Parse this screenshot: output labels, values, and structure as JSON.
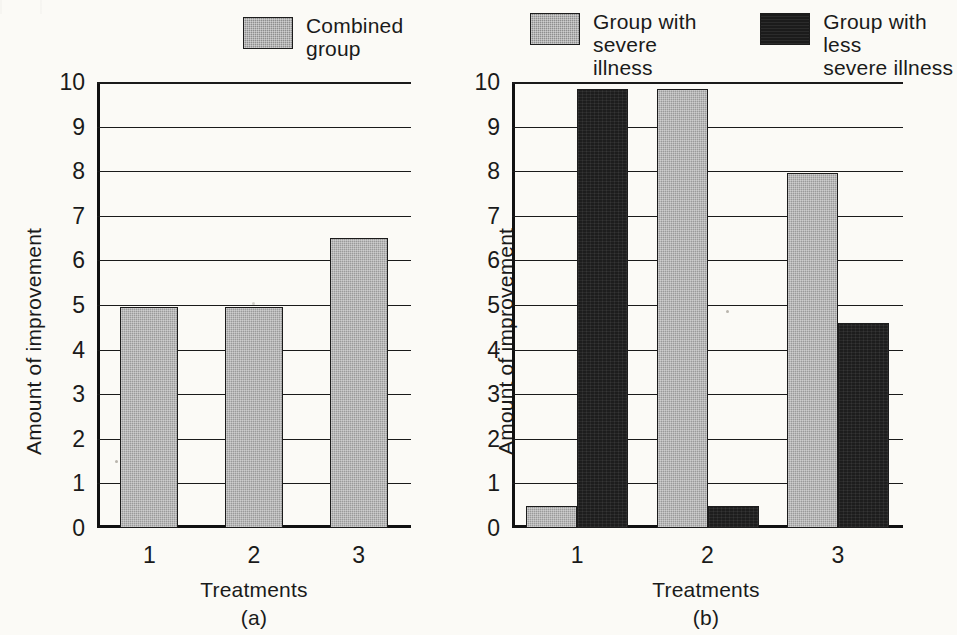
{
  "figure": {
    "background_color": "#fbfaf6",
    "series_colors": {
      "gray": "#9a9a9a",
      "black": "#1d1d1d"
    }
  },
  "panel_a": {
    "tag": "(a)",
    "legend": [
      {
        "name": "combined-group",
        "label": "Combined\ngroup",
        "color": "#9a9a9a"
      }
    ],
    "ylabel": "Amount of improvement",
    "xlabel": "Treatments",
    "yticks": [
      "10",
      "9",
      "8",
      "7",
      "6",
      "5",
      "4",
      "3",
      "2",
      "1",
      "0"
    ],
    "xticks": [
      "1",
      "2",
      "3"
    ]
  },
  "panel_b": {
    "tag": "(b)",
    "legend": [
      {
        "name": "group-severe",
        "label": "Group with\nsevere illness",
        "color": "#9a9a9a"
      },
      {
        "name": "group-less-severe",
        "label": "Group with less\nsevere illness",
        "color": "#1d1d1d"
      }
    ],
    "ylabel": "Amount of improvement",
    "xlabel": "Treatments",
    "yticks": [
      "10",
      "9",
      "8",
      "7",
      "6",
      "5",
      "4",
      "3",
      "2",
      "1",
      "0"
    ],
    "xticks": [
      "1",
      "2",
      "3"
    ]
  },
  "chart_data": [
    {
      "type": "bar",
      "panel": "(a)",
      "title": "",
      "xlabel": "Treatments",
      "ylabel": "Amount of improvement",
      "categories": [
        "1",
        "2",
        "3"
      ],
      "series": [
        {
          "name": "Combined group",
          "color": "#9a9a9a",
          "values": [
            4.95,
            4.95,
            6.5
          ]
        }
      ],
      "ylim": [
        0,
        10
      ],
      "ytick_step": 1,
      "grid": true,
      "legend_position": "top-right"
    },
    {
      "type": "bar",
      "panel": "(b)",
      "title": "",
      "xlabel": "Treatments",
      "ylabel": "Amount of improvement",
      "categories": [
        "1",
        "2",
        "3"
      ],
      "series": [
        {
          "name": "Group with severe illness",
          "color": "#9a9a9a",
          "values": [
            0.5,
            9.85,
            7.95
          ]
        },
        {
          "name": "Group with less severe illness",
          "color": "#1d1d1d",
          "values": [
            9.85,
            0.5,
            4.6
          ]
        }
      ],
      "ylim": [
        0,
        10
      ],
      "ytick_step": 1,
      "grid": true,
      "legend_position": "top"
    }
  ]
}
